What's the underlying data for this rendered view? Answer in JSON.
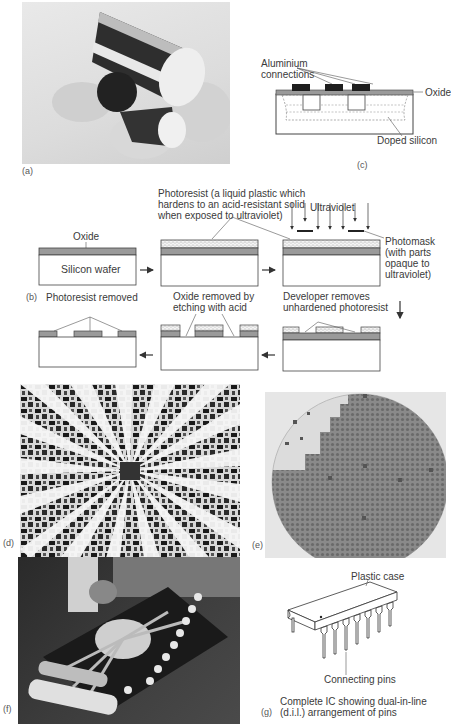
{
  "panels": {
    "a": {
      "tag": "(a)",
      "description": "Photo of silicon ingot cylinder with sliced wafers"
    },
    "b": {
      "tag": "(b)",
      "step_labels": {
        "oxide": "Oxide",
        "silicon_wafer": "Silicon wafer",
        "photoresist_line1": "Photoresist (a liquid plastic which",
        "photoresist_line2": "hardens to an acid-resistant solid",
        "photoresist_line3": "when exposed to ultraviolet)",
        "ultraviolet": "Ultraviolet",
        "photomask_line1": "Photomask",
        "photomask_line2": "(with parts",
        "photomask_line3": "opaque to",
        "photomask_line4": "ultraviolet)",
        "developer_line1": "Developer removes",
        "developer_line2": "unhardened photoresist",
        "oxide_removed_line1": "Oxide removed by",
        "oxide_removed_line2": "etching with acid",
        "photoresist_removed": "Photoresist removed"
      }
    },
    "c": {
      "tag": "(c)",
      "aluminium_line1": "Aluminium",
      "aluminium_line2": "connections",
      "oxide": "Oxide",
      "doped_silicon": "Doped silicon"
    },
    "d": {
      "tag": "(d)",
      "description": "Micrograph of IC chip with radiating bond leads"
    },
    "e": {
      "tag": "(e)",
      "description": "Photo of silicon wafer with grid of chips"
    },
    "f": {
      "tag": "(f)",
      "description": "Photo of chip being bonded in dual-in-line package"
    },
    "g": {
      "tag": "(g)",
      "plastic_case": "Plastic case",
      "connecting_pins": "Connecting pins",
      "caption_line1": "Complete IC showing dual-in-line",
      "caption_line2": "(d.i.l.) arrangement of pins"
    }
  }
}
